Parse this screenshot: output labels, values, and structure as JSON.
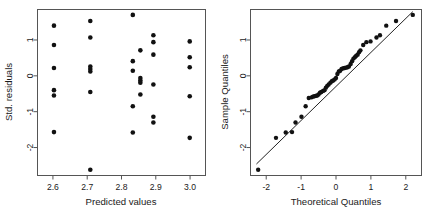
{
  "figure": {
    "kind": "regression-diagnostic-plots",
    "panel_count": 2
  },
  "chart_data": [
    {
      "type": "scatter",
      "name": "residuals-vs-fitted",
      "title": "",
      "xlabel": "Predicted values",
      "ylabel": "Std. residuals",
      "xlim": [
        2.555,
        3.045
      ],
      "ylim": [
        -2.78,
        1.85
      ],
      "xticks": [
        2.6,
        2.7,
        2.8,
        2.9,
        3.0
      ],
      "xticklabels": [
        "2.6",
        "2.7",
        "2.8",
        "2.9",
        "3.0"
      ],
      "yticks": [
        1,
        0,
        -1,
        -2
      ],
      "yticklabels": [
        "1",
        "0",
        "-1",
        "-2"
      ],
      "grid": false,
      "legend": "none",
      "x": [
        2.603,
        2.603,
        2.603,
        2.603,
        2.603,
        2.603,
        2.709,
        2.709,
        2.709,
        2.709,
        2.709,
        2.709,
        2.709,
        2.833,
        2.833,
        2.833,
        2.833,
        2.833,
        2.855,
        2.855,
        2.855,
        2.855,
        2.855,
        2.893,
        2.893,
        2.893,
        2.893,
        2.893,
        2.893,
        2.999,
        2.999,
        2.999,
        2.999,
        2.999
      ],
      "y": [
        1.4,
        0.86,
        0.22,
        -0.4,
        -0.55,
        -1.57,
        1.53,
        1.07,
        0.26,
        0.19,
        0.12,
        -0.45,
        -2.62,
        1.7,
        0.41,
        0.14,
        -0.85,
        -1.58,
        0.71,
        -0.06,
        -0.13,
        -0.19,
        -0.52,
        1.13,
        0.94,
        0.59,
        -0.24,
        -1.14,
        -1.3,
        0.96,
        0.52,
        0.24,
        -0.57,
        -1.73
      ]
    },
    {
      "type": "scatter",
      "name": "normal-qq",
      "title": "",
      "xlabel": "Theoretical Quantiles",
      "ylabel": "Sample Quantiles",
      "xlim": [
        -2.45,
        2.45
      ],
      "ylim": [
        -2.78,
        1.85
      ],
      "xticks": [
        -2,
        -1,
        0,
        1,
        2
      ],
      "xticklabels": [
        "-2",
        "-1",
        "0",
        "1",
        "2"
      ],
      "yticks": [
        1,
        0,
        -1,
        -2
      ],
      "yticklabels": [
        "1",
        "0",
        "-1",
        "-2"
      ],
      "grid": false,
      "legend": "none",
      "reference_line": {
        "x": [
          -2.28,
          2.2
        ],
        "y": [
          -2.46,
          1.79
        ]
      },
      "x": [
        -2.23,
        -1.72,
        -1.44,
        -1.26,
        -1.16,
        -0.99,
        -0.87,
        -0.78,
        -0.7,
        -0.66,
        -0.62,
        -0.58,
        -0.54,
        -0.5,
        -0.46,
        -0.42,
        -0.37,
        -0.33,
        -0.29,
        -0.25,
        -0.21,
        -0.16,
        -0.12,
        -0.08,
        -0.04,
        0.0,
        0.04,
        0.08,
        0.12,
        0.16,
        0.21,
        0.25,
        0.29,
        0.33,
        0.37,
        0.42,
        0.46,
        0.5,
        0.54,
        0.58,
        0.62,
        0.66,
        0.7,
        0.78,
        0.87,
        0.99,
        1.16,
        1.26,
        1.44,
        1.72,
        2.2
      ],
      "y": [
        -2.62,
        -1.73,
        -1.58,
        -1.57,
        -1.3,
        -1.14,
        -0.85,
        -0.62,
        -0.6,
        -0.58,
        -0.57,
        -0.56,
        -0.55,
        -0.52,
        -0.47,
        -0.45,
        -0.42,
        -0.4,
        -0.33,
        -0.28,
        -0.24,
        -0.19,
        -0.15,
        -0.13,
        -0.1,
        -0.06,
        0.05,
        0.12,
        0.14,
        0.19,
        0.21,
        0.22,
        0.23,
        0.24,
        0.26,
        0.33,
        0.41,
        0.48,
        0.52,
        0.56,
        0.59,
        0.66,
        0.71,
        0.86,
        0.94,
        0.96,
        1.07,
        1.13,
        1.4,
        1.53,
        1.7
      ]
    }
  ],
  "colors": {
    "point": "#111111",
    "frame": "#555555",
    "text": "#1a1a1a",
    "line": "#222222",
    "background": "#ffffff"
  }
}
